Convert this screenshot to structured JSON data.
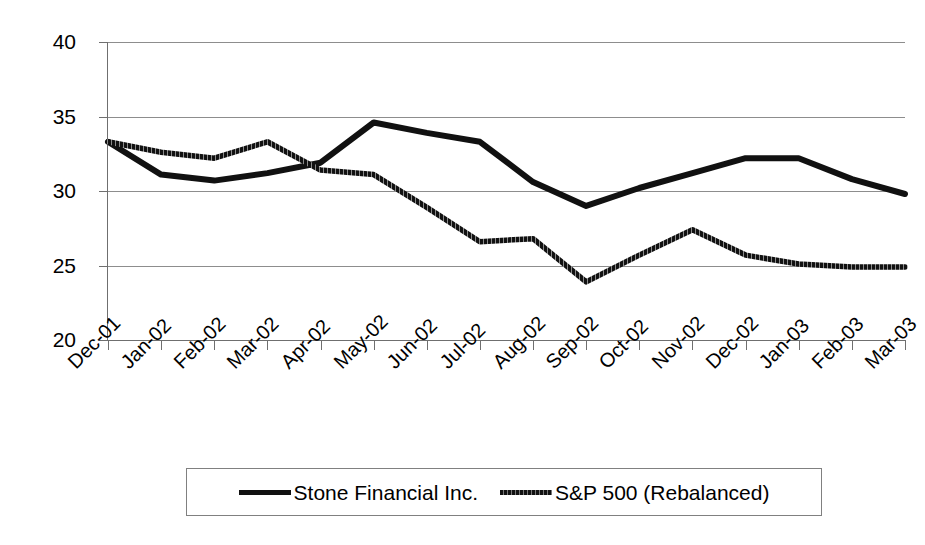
{
  "chart_data": {
    "type": "line",
    "title": "",
    "xlabel": "",
    "ylabel": "",
    "ylim": [
      20,
      40
    ],
    "ytick_values": [
      20,
      25,
      30,
      35,
      40
    ],
    "ytick_labels": [
      "20",
      "25",
      "30",
      "35",
      "40"
    ],
    "grid": true,
    "grid_axis": "y",
    "legend_position": "bottom",
    "categories": [
      "Dec-01",
      "Jan-02",
      "Feb-02",
      "Mar-02",
      "Apr-02",
      "May-02",
      "Jun-02",
      "Jul-02",
      "Aug-02",
      "Sep-02",
      "Oct-02",
      "Nov-02",
      "Dec-02",
      "Jan-03",
      "Feb-03",
      "Mar-03"
    ],
    "series": [
      {
        "name": "Stone Financial Inc.",
        "style": "solid",
        "color": "#111111",
        "values": [
          33.3,
          31.1,
          30.7,
          31.2,
          31.9,
          34.6,
          33.9,
          33.3,
          30.6,
          29.0,
          30.2,
          31.2,
          32.2,
          32.2,
          30.8,
          29.8
        ]
      },
      {
        "name": "S&P 500 (Rebalanced)",
        "style": "textured",
        "color": "#111111",
        "values": [
          33.3,
          32.6,
          32.2,
          33.3,
          31.4,
          31.1,
          28.9,
          26.6,
          26.8,
          23.9,
          25.7,
          27.4,
          25.7,
          25.1,
          24.9,
          24.9
        ]
      }
    ]
  },
  "legend": {
    "items": [
      {
        "label": "Stone Financial Inc.",
        "style": "solid"
      },
      {
        "label": "S&P 500 (Rebalanced)",
        "style": "textured"
      }
    ]
  },
  "colors": {
    "axis": "#6f6f6f",
    "grid": "#8d8d8d",
    "line": "#111111",
    "background": "#ffffff"
  }
}
